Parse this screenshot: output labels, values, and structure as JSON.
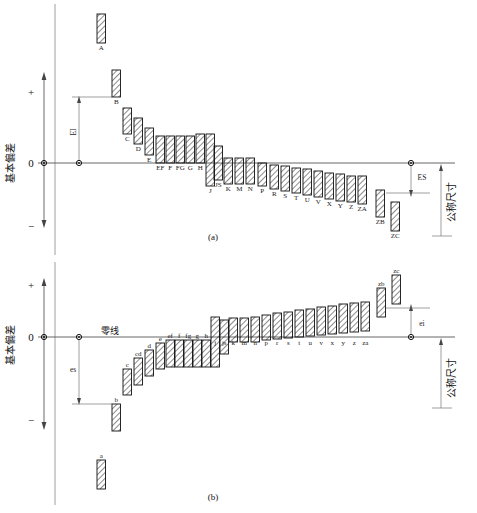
{
  "figure": {
    "title_caption_a": "(a)",
    "title_caption_b": "(b)",
    "axis_label_vertical": "基本偏差",
    "nominal_size_label": "公称尺寸",
    "zero_line_label": "零线",
    "plus_sign": "+",
    "minus_sign": "−",
    "zero_tick": "0",
    "colors": {
      "ink": "#111111",
      "line": "#555555",
      "hatch": "#1a1a1a",
      "background": "#ffffff"
    }
  },
  "panel_a": {
    "name": "holes-upper-deviation-chart",
    "caption": "(a)",
    "dimension_labels": {
      "left": "EI",
      "right": "ES"
    },
    "bars": [
      {
        "label": "A",
        "x": 97,
        "top": 14,
        "bottom": 43,
        "above_zero": true,
        "detached": true
      },
      {
        "label": "B",
        "x": 112,
        "top": 70,
        "bottom": 97,
        "above_zero": true,
        "detached": true
      },
      {
        "label": "C",
        "x": 123,
        "top": 108,
        "bottom": 134,
        "above_zero": true,
        "detached": true
      },
      {
        "label": "D",
        "x": 134,
        "top": 118,
        "bottom": 144,
        "above_zero": true,
        "detached": true
      },
      {
        "label": "E",
        "x": 145,
        "top": 128,
        "bottom": 155,
        "above_zero": true,
        "detached": true
      },
      {
        "label": "EF",
        "x": 156,
        "top": 136,
        "bottom": 163,
        "above_zero": true,
        "detached": false
      },
      {
        "label": "F",
        "x": 166,
        "top": 136,
        "bottom": 163,
        "above_zero": true,
        "detached": false
      },
      {
        "label": "FG",
        "x": 176,
        "top": 136,
        "bottom": 163,
        "above_zero": true,
        "detached": false
      },
      {
        "label": "G",
        "x": 186,
        "top": 136,
        "bottom": 163,
        "above_zero": true,
        "detached": false
      },
      {
        "label": "H",
        "x": 196,
        "top": 134,
        "bottom": 163,
        "above_zero": true,
        "detached": false
      },
      {
        "label": "J",
        "x": 206,
        "top": 134,
        "bottom": 186,
        "above_zero": false,
        "detached": false
      },
      {
        "label": "JS",
        "x": 214,
        "top": 146,
        "bottom": 180,
        "above_zero": false,
        "detached": false
      },
      {
        "label": "K",
        "x": 224,
        "top": 158,
        "bottom": 184,
        "above_zero": false,
        "detached": false
      },
      {
        "label": "M",
        "x": 235,
        "top": 158,
        "bottom": 184,
        "above_zero": false,
        "detached": false
      },
      {
        "label": "N",
        "x": 246,
        "top": 158,
        "bottom": 184,
        "above_zero": false,
        "detached": false
      },
      {
        "label": "P",
        "x": 258,
        "top": 163,
        "bottom": 186,
        "above_zero": false,
        "detached": false
      },
      {
        "label": "R",
        "x": 270,
        "top": 165,
        "bottom": 189,
        "above_zero": false,
        "detached": false
      },
      {
        "label": "S",
        "x": 281,
        "top": 166,
        "bottom": 191,
        "above_zero": false,
        "detached": false
      },
      {
        "label": "T",
        "x": 292,
        "top": 168,
        "bottom": 193,
        "above_zero": false,
        "detached": false
      },
      {
        "label": "U",
        "x": 303,
        "top": 169,
        "bottom": 195,
        "above_zero": false,
        "detached": false
      },
      {
        "label": "V",
        "x": 314,
        "top": 171,
        "bottom": 197,
        "above_zero": false,
        "detached": false
      },
      {
        "label": "X",
        "x": 325,
        "top": 173,
        "bottom": 199,
        "above_zero": false,
        "detached": false
      },
      {
        "label": "Y",
        "x": 336,
        "top": 174,
        "bottom": 201,
        "above_zero": false,
        "detached": false
      },
      {
        "label": "Z",
        "x": 347,
        "top": 176,
        "bottom": 202,
        "above_zero": false,
        "detached": false
      },
      {
        "label": "ZA",
        "x": 358,
        "top": 176,
        "bottom": 204,
        "above_zero": false,
        "detached": false
      },
      {
        "label": "ZB",
        "x": 376,
        "top": 190,
        "bottom": 217,
        "above_zero": false,
        "detached": true
      },
      {
        "label": "ZC",
        "x": 391,
        "top": 202,
        "bottom": 231,
        "above_zero": false,
        "detached": true
      }
    ]
  },
  "panel_b": {
    "name": "shafts-lower-deviation-chart",
    "caption": "(b)",
    "dimension_labels": {
      "left": "es",
      "right": "ei"
    },
    "zero_line_label": "零线",
    "bars": [
      {
        "label": "a",
        "x": 97,
        "top": 460,
        "bottom": 489,
        "above_zero": false,
        "detached": true
      },
      {
        "label": "b",
        "x": 112,
        "top": 404,
        "bottom": 431,
        "above_zero": false,
        "detached": true
      },
      {
        "label": "c",
        "x": 123,
        "top": 369,
        "bottom": 395,
        "above_zero": false,
        "detached": true
      },
      {
        "label": "cd",
        "x": 134,
        "top": 358,
        "bottom": 385,
        "above_zero": false,
        "detached": true
      },
      {
        "label": "d",
        "x": 145,
        "top": 350,
        "bottom": 376,
        "above_zero": false,
        "detached": true
      },
      {
        "label": "e",
        "x": 156,
        "top": 343,
        "bottom": 369,
        "above_zero": false,
        "detached": false
      },
      {
        "label": "ef",
        "x": 166,
        "top": 340,
        "bottom": 367,
        "above_zero": false,
        "detached": false
      },
      {
        "label": "f",
        "x": 175,
        "top": 340,
        "bottom": 367,
        "above_zero": false,
        "detached": false
      },
      {
        "label": "fg",
        "x": 184,
        "top": 340,
        "bottom": 367,
        "above_zero": false,
        "detached": false
      },
      {
        "label": "g",
        "x": 193,
        "top": 340,
        "bottom": 367,
        "above_zero": false,
        "detached": false
      },
      {
        "label": "h",
        "x": 202,
        "top": 340,
        "bottom": 367,
        "above_zero": false,
        "detached": false
      },
      {
        "label": "j",
        "x": 211,
        "top": 317,
        "bottom": 367,
        "above_zero": true,
        "detached": false
      },
      {
        "label": "js",
        "x": 220,
        "top": 320,
        "bottom": 354,
        "above_zero": true,
        "detached": false
      },
      {
        "label": "k",
        "x": 229,
        "top": 318,
        "bottom": 342,
        "above_zero": true,
        "detached": false
      },
      {
        "label": "m",
        "x": 240,
        "top": 318,
        "bottom": 342,
        "above_zero": true,
        "detached": false
      },
      {
        "label": "n",
        "x": 251,
        "top": 317,
        "bottom": 342,
        "above_zero": true,
        "detached": false
      },
      {
        "label": "p",
        "x": 262,
        "top": 315,
        "bottom": 340,
        "above_zero": true,
        "detached": false
      },
      {
        "label": "r",
        "x": 273,
        "top": 313,
        "bottom": 339,
        "above_zero": true,
        "detached": false
      },
      {
        "label": "s",
        "x": 284,
        "top": 312,
        "bottom": 338,
        "above_zero": true,
        "detached": false
      },
      {
        "label": "t",
        "x": 295,
        "top": 310,
        "bottom": 337,
        "above_zero": true,
        "detached": false
      },
      {
        "label": "u",
        "x": 306,
        "top": 309,
        "bottom": 336,
        "above_zero": true,
        "detached": false
      },
      {
        "label": "v",
        "x": 317,
        "top": 307,
        "bottom": 335,
        "above_zero": true,
        "detached": false
      },
      {
        "label": "x",
        "x": 328,
        "top": 306,
        "bottom": 334,
        "above_zero": true,
        "detached": false
      },
      {
        "label": "y",
        "x": 339,
        "top": 304,
        "bottom": 333,
        "above_zero": true,
        "detached": false
      },
      {
        "label": "z",
        "x": 350,
        "top": 303,
        "bottom": 332,
        "above_zero": true,
        "detached": false
      },
      {
        "label": "za",
        "x": 361,
        "top": 302,
        "bottom": 331,
        "above_zero": true,
        "detached": false
      },
      {
        "label": "zb",
        "x": 377,
        "top": 288,
        "bottom": 317,
        "above_zero": true,
        "detached": true
      },
      {
        "label": "zc",
        "x": 392,
        "top": 275,
        "bottom": 304,
        "above_zero": true,
        "detached": true
      }
    ]
  }
}
